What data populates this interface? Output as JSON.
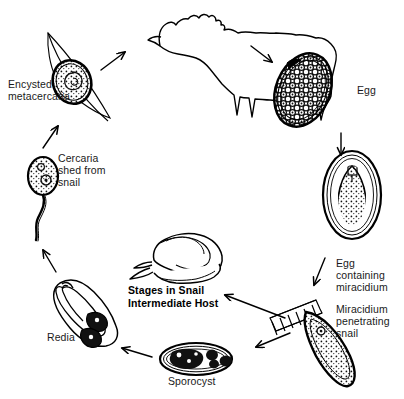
{
  "diagram": {
    "title": "Stages in Snail Intermediate Host",
    "background_color": "#ffffff",
    "ink_color": "#000000",
    "text_color": "#1a1a1a"
  },
  "labels": {
    "encysted_metacercaria": "Encysted\nmetacercaria",
    "egg": "Egg",
    "egg_containing_miracidium": "Egg\ncontaining\nmiracidium",
    "miracidium_penetrating_snail": "Miracidium\npenetrating\nsnail",
    "sporocyst": "Sporocyst",
    "redia": "Redia",
    "cercaria_shed_from_snail": "Cercaria\nshed from\nsnail",
    "stages_in_snail_intermediate_host": "Stages in Snail\nIntermediate Host"
  },
  "stages": [
    {
      "id": "encysted-metacercaria",
      "name": "Encysted metacercaria on grass blade",
      "label": "Encysted\nmetacercaria"
    },
    {
      "id": "sheep-definitive-host",
      "name": "Sheep definitive host",
      "label": ""
    },
    {
      "id": "egg",
      "name": "Egg",
      "label": "Egg"
    },
    {
      "id": "egg-containing-miracidium",
      "name": "Egg containing miracidium",
      "label": "Egg\ncontaining\nmiracidium"
    },
    {
      "id": "miracidium-penetrating-snail",
      "name": "Miracidium penetrating snail",
      "label": "Miracidium\npenetrating\nsnail"
    },
    {
      "id": "sporocyst",
      "name": "Sporocyst",
      "label": "Sporocyst"
    },
    {
      "id": "redia",
      "name": "Redia",
      "label": "Redia"
    },
    {
      "id": "cercaria",
      "name": "Cercaria shed from snail",
      "label": "Cercaria\nshed from\nsnail"
    },
    {
      "id": "snail-intermediate-host",
      "name": "Snail intermediate host",
      "label": "Stages in Snail\nIntermediate Host"
    }
  ],
  "arrows": [
    {
      "id": "arrow-metacercaria-to-sheep",
      "from": "encysted-metacercaria",
      "to": "sheep-definitive-host"
    },
    {
      "id": "arrow-sheep-to-egg",
      "from": "sheep-definitive-host",
      "to": "egg"
    },
    {
      "id": "arrow-egg-to-egg-miracidium",
      "from": "egg",
      "to": "egg-containing-miracidium"
    },
    {
      "id": "arrow-egg-miracidium-to-penetrating",
      "from": "egg-containing-miracidium",
      "to": "miracidium-penetrating-snail"
    },
    {
      "id": "arrow-penetrating-to-snail",
      "from": "miracidium-penetrating-snail",
      "to": "snail-intermediate-host"
    },
    {
      "id": "arrow-penetrating-to-sporocyst",
      "from": "miracidium-penetrating-snail",
      "to": "sporocyst"
    },
    {
      "id": "arrow-sporocyst-to-redia",
      "from": "sporocyst",
      "to": "redia"
    },
    {
      "id": "arrow-redia-to-cercaria",
      "from": "redia",
      "to": "cercaria"
    },
    {
      "id": "arrow-cercaria-to-metacercaria",
      "from": "cercaria",
      "to": "encysted-metacercaria"
    }
  ]
}
